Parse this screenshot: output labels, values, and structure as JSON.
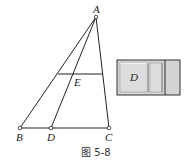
{
  "figure": {
    "caption": "图 5-8",
    "points": {
      "A": {
        "label": "A",
        "x": 96,
        "y": 17
      },
      "B": {
        "label": "B",
        "x": 20,
        "y": 128
      },
      "D": {
        "label": "D",
        "x": 51,
        "y": 128
      },
      "C": {
        "label": "C",
        "x": 109,
        "y": 128
      },
      "E": {
        "label": "E",
        "x": 74,
        "y": 74
      }
    },
    "segments": [
      [
        "A",
        "B"
      ],
      [
        "A",
        "D"
      ],
      [
        "A",
        "C"
      ],
      [
        "B",
        "C"
      ],
      [
        "F",
        "G"
      ]
    ],
    "parallel_line": {
      "x1": 58,
      "y1": 74,
      "x2": 103,
      "y2": 74
    },
    "box": {
      "label": "D",
      "fill": "#d4d4d4",
      "stroke": "#333333"
    }
  }
}
